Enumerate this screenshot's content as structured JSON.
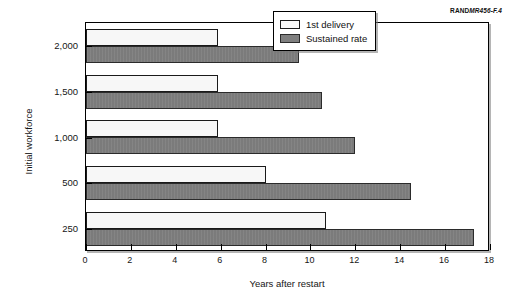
{
  "figure_id": {
    "brand": "RAND",
    "code": "MR456-F.4",
    "full": "RANDMR456-F.4"
  },
  "legend": {
    "position": "top-right-inside",
    "entries": [
      {
        "label": "1st delivery",
        "swatch": "white-swatch",
        "color": "#f7f7f7"
      },
      {
        "label": "Sustained rate",
        "swatch": "gray-swatch",
        "color": "#7f7f7f"
      }
    ]
  },
  "axes": {
    "x": {
      "title": "Years after restart",
      "min": 0,
      "max": 18,
      "step": 2,
      "ticks": [
        "0",
        "2",
        "4",
        "6",
        "8",
        "10",
        "12",
        "14",
        "16",
        "18"
      ]
    },
    "y": {
      "title": "Initial workforce",
      "ticks": [
        "2,000",
        "1,500",
        "1,000",
        "500",
        "250"
      ]
    }
  },
  "chart_data": {
    "type": "bar",
    "orientation": "horizontal",
    "title": "",
    "subtitle": "",
    "xlabel": "Years after restart",
    "ylabel": "Initial workforce",
    "xlim": [
      0,
      18
    ],
    "xticks": [
      0,
      2,
      4,
      6,
      8,
      10,
      12,
      14,
      16,
      18
    ],
    "grid": false,
    "legend_position": "upper right",
    "categories": [
      "2,000",
      "1,500",
      "1,000",
      "500",
      "250"
    ],
    "series": [
      {
        "name": "1st delivery",
        "color": "#f7f7f7",
        "values": [
          5.9,
          5.9,
          5.9,
          8.0,
          10.7
        ]
      },
      {
        "name": "Sustained rate",
        "color": "#7f7f7f",
        "values": [
          9.5,
          10.5,
          12.0,
          14.5,
          17.3
        ]
      }
    ],
    "annotations": [
      "RANDMR456-F.4"
    ]
  }
}
